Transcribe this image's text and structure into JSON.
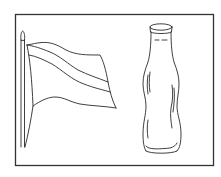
{
  "illustration": {
    "subjects": [
      "flag",
      "bottle"
    ],
    "style": "black line drawing on white",
    "colors": {
      "background": "#ffffff",
      "line": "#2a2a2a",
      "frame": "#333333"
    }
  }
}
